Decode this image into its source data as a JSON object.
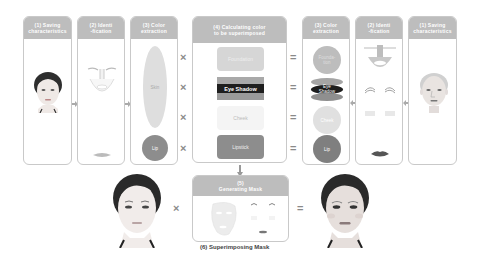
{
  "steps": {
    "left": [
      {
        "title": "(1) Saving\ncharacteristics"
      },
      {
        "title": "(2) Identi\n-fication"
      },
      {
        "title": "(3) Color\nextraction",
        "skin_label": "Skin",
        "lip_label": "Lip"
      }
    ],
    "center": {
      "title": "(4) Calculating  color\nto be superimposed",
      "items": [
        "Foundation",
        "Eye Shadow",
        "Cheek",
        "Lipstick"
      ]
    },
    "right": [
      {
        "title": "(3) Color\nextraction",
        "items": [
          "Founda-\ntion",
          "Eye\nShadow",
          "Cheek",
          "Lip"
        ]
      },
      {
        "title": "(2) Identi\n-fication"
      },
      {
        "title": "(1) Saving\ncharacteristics"
      }
    ],
    "mask": {
      "title": "(5)\nGenerating Mask"
    },
    "caption": "(6) Superimposing Mask"
  },
  "operators": {
    "multiply": "×",
    "equals": "="
  },
  "colors": {
    "header_gray": "#bdbdbd",
    "border": "#c9c9c9",
    "foundation": "#d6d6d6",
    "eye_shadow_band": "#a9a9a9",
    "eye_shadow_dark": "#1e1e1e",
    "cheek": "#ececec",
    "lip": "#8d8d8d",
    "skin": "#dedede"
  }
}
